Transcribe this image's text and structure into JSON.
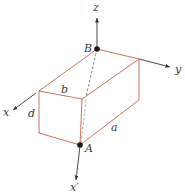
{
  "diagram": {
    "type": "3d-box-axes",
    "colors": {
      "box": "#c9735e",
      "axis": "#333333",
      "point": "#1a1a1a"
    },
    "axes": [
      {
        "name": "z",
        "label": "z"
      },
      {
        "name": "y",
        "label": "y"
      },
      {
        "name": "x",
        "label": "x"
      },
      {
        "name": "x-prime",
        "label": "x′"
      }
    ],
    "points": [
      {
        "name": "B",
        "label": "B"
      },
      {
        "name": "A",
        "label": "A"
      }
    ],
    "dimensions": [
      {
        "name": "b",
        "label": "b"
      },
      {
        "name": "d",
        "label": "d"
      },
      {
        "name": "a",
        "label": "a"
      }
    ]
  }
}
